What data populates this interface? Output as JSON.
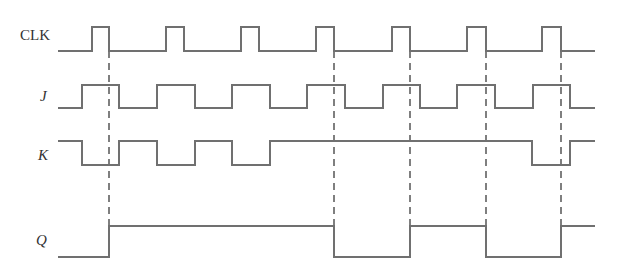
{
  "colors": {
    "wave": "#707070",
    "dash": "#555555",
    "label": "#333333",
    "background": "#ffffff"
  },
  "labels": {
    "clk": "CLK",
    "j": "J",
    "k": "K",
    "q": "Q"
  },
  "signals": [
    {
      "name": "CLK",
      "high_y": 27,
      "low_y": 51,
      "start_x": 58,
      "end_x": 595,
      "initial": 0,
      "transitions_x": [
        92,
        109,
        166,
        184,
        241,
        259,
        316,
        334,
        392,
        410,
        467,
        486,
        542,
        561
      ]
    },
    {
      "name": "J",
      "high_y": 85,
      "low_y": 108,
      "start_x": 58,
      "end_x": 595,
      "initial": 0,
      "transitions_x": [
        82,
        119,
        157,
        195,
        232,
        270,
        307,
        345,
        383,
        420,
        457,
        495,
        533,
        570
      ]
    },
    {
      "name": "K",
      "high_y": 141,
      "low_y": 165,
      "start_x": 58,
      "end_x": 595,
      "initial": 1,
      "transitions_x": [
        82,
        119,
        157,
        195,
        232,
        270,
        532,
        570
      ]
    },
    {
      "name": "Q",
      "high_y": 226,
      "low_y": 257,
      "start_x": 58,
      "end_x": 595,
      "initial": 0,
      "transitions_x": [
        109,
        334,
        410,
        486,
        561
      ]
    }
  ],
  "dashed_markers": [
    {
      "x": 109,
      "y1": 51,
      "y2": 226
    },
    {
      "x": 334,
      "y1": 51,
      "y2": 257
    },
    {
      "x": 410,
      "y1": 51,
      "y2": 226
    },
    {
      "x": 486,
      "y1": 51,
      "y2": 257
    },
    {
      "x": 561,
      "y1": 51,
      "y2": 226
    }
  ],
  "label_positions": {
    "clk": {
      "x": 20,
      "y": 40
    },
    "j": {
      "x": 40,
      "y": 101
    },
    "k": {
      "x": 38,
      "y": 160
    },
    "q": {
      "x": 36,
      "y": 245
    }
  }
}
